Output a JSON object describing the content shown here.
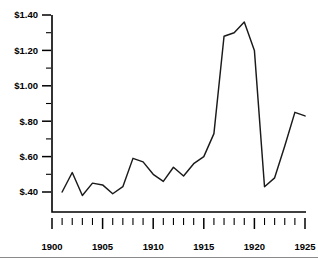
{
  "chart_data": {
    "type": "line",
    "title": "",
    "subtitle": "",
    "xlabel": "",
    "ylabel": "",
    "xlim": [
      1900,
      1925
    ],
    "ylim": [
      0.3,
      1.4
    ],
    "grid": false,
    "legend": null,
    "x_tick_labels": [
      "1900",
      "1905",
      "1910",
      "1915",
      "1920",
      "1925"
    ],
    "x_major_ticks": [
      1900,
      1905,
      1910,
      1915,
      1920,
      1925
    ],
    "x_minor_tick_interval": 1,
    "y_tick_labels": [
      "$1.40",
      "$1.20",
      "$1.00",
      "$.80",
      "$.60",
      "$.40"
    ],
    "y_major_ticks": [
      1.4,
      1.2,
      1.0,
      0.8,
      0.6,
      0.4
    ],
    "y_minor_ticks": [
      1.3,
      1.1,
      0.9,
      0.7,
      0.5
    ],
    "x": [
      1901,
      1902,
      1903,
      1904,
      1905,
      1906,
      1907,
      1908,
      1909,
      1910,
      1911,
      1912,
      1913,
      1914,
      1915,
      1916,
      1917,
      1918,
      1919,
      1920,
      1921,
      1922,
      1923,
      1924,
      1925
    ],
    "values": [
      0.4,
      0.51,
      0.38,
      0.45,
      0.44,
      0.39,
      0.43,
      0.59,
      0.57,
      0.5,
      0.46,
      0.54,
      0.49,
      0.56,
      0.6,
      0.73,
      1.28,
      1.3,
      1.36,
      1.2,
      0.43,
      0.48,
      0.66,
      0.85,
      0.83
    ],
    "series": [
      {
        "name": "price",
        "values": [
          0.4,
          0.51,
          0.38,
          0.45,
          0.44,
          0.39,
          0.43,
          0.59,
          0.57,
          0.5,
          0.46,
          0.54,
          0.49,
          0.56,
          0.6,
          0.73,
          1.28,
          1.3,
          1.36,
          1.2,
          0.43,
          0.48,
          0.66,
          0.85,
          0.83
        ],
        "color": "#1a1a1a"
      }
    ]
  },
  "axes": {
    "y_labels": [
      "$1.40",
      "$1.20",
      "$1.00",
      "$.80",
      "$.60",
      "$.40"
    ],
    "x_labels": [
      "1900",
      "1905",
      "1910",
      "1915",
      "1920",
      "1925"
    ]
  },
  "colors": {
    "line": "#1a1a1a",
    "axis": "#000000",
    "background": "#ffffff",
    "rule": "#8a8a8a"
  }
}
